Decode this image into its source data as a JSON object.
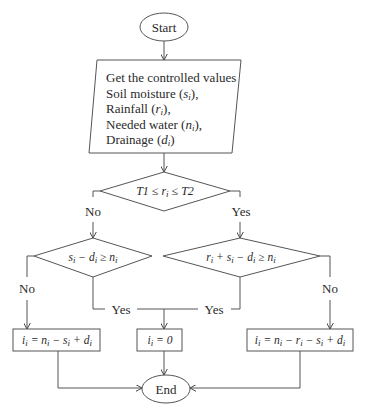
{
  "flowchart": {
    "start": {
      "label": "Start"
    },
    "input": {
      "lines": [
        "Get the controlled values",
        "Soil moisture (s_i),",
        "Rainfall (r_i),",
        "Needed water (n_i),",
        "Drainage (d_i)"
      ],
      "line_parts": [
        {
          "text": "Get the controlled values",
          "var": "",
          "sub": "",
          "suffix": ""
        },
        {
          "text": "Soil moisture (",
          "var": "s",
          "sub": "i",
          "suffix": "),"
        },
        {
          "text": "Rainfall (",
          "var": "r",
          "sub": "i",
          "suffix": "),"
        },
        {
          "text": "Needed water (",
          "var": "n",
          "sub": "i",
          "suffix": "),"
        },
        {
          "text": "Drainage (",
          "var": "d",
          "sub": "i",
          "suffix": ")"
        }
      ]
    },
    "decision_1": {
      "condition": "T1 ≤ r_i ≤ T2",
      "no_label": "No",
      "yes_label": "Yes"
    },
    "decision_2": {
      "condition": "s_i − d_i ≥ n_i",
      "no_label": "No",
      "yes_label": "Yes"
    },
    "decision_3": {
      "condition": "r_i + s_i − d_i ≥ n_i",
      "no_label": "No",
      "yes_label": "Yes"
    },
    "process_left": {
      "formula": "i_i = n_i − s_i + d_i"
    },
    "process_center": {
      "formula": "i_i = 0"
    },
    "process_right": {
      "formula": "i_i = n_i − r_i − s_i + d_i"
    },
    "end": {
      "label": "End"
    }
  }
}
